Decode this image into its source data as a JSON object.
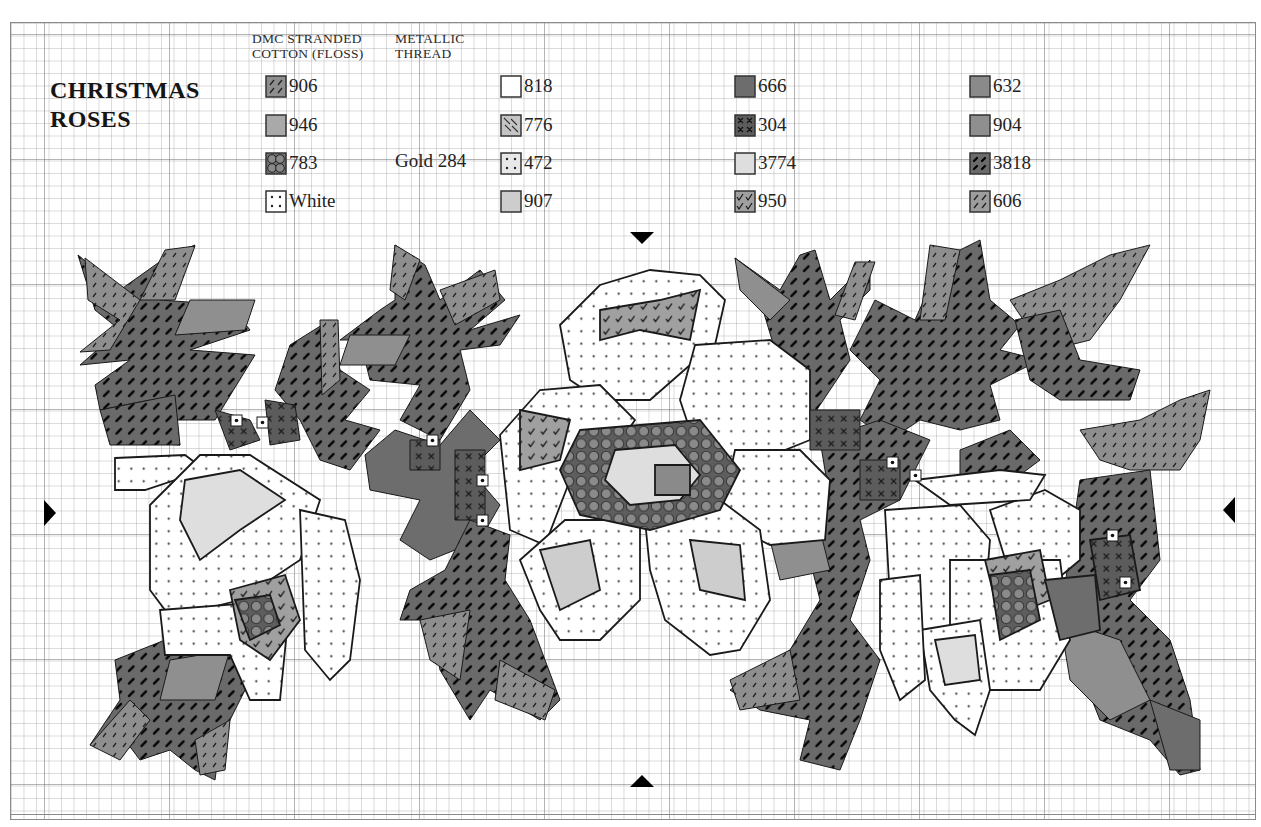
{
  "chart": {
    "title_lines": [
      "CHRISTMAS",
      "ROSES"
    ],
    "legend_headers": {
      "stranded": [
        "DMC STRANDED",
        "COTTON (FLOSS)"
      ],
      "metallic": [
        "METALLIC",
        "THREAD"
      ]
    },
    "metallic_thread": "Gold 284",
    "legend": [
      {
        "code": "906",
        "symbol": "diag-dash",
        "fill": "#8e8e8e",
        "col": 0,
        "row": 0
      },
      {
        "code": "946",
        "symbol": "solid",
        "fill": "#a9a9a9",
        "col": 0,
        "row": 1
      },
      {
        "code": "783",
        "symbol": "circles",
        "fill": "#707070",
        "col": 0,
        "row": 2
      },
      {
        "code": "White",
        "symbol": "dots",
        "fill": "#ffffff",
        "col": 0,
        "row": 3
      },
      {
        "code": "818",
        "symbol": "blank",
        "fill": "#ffffff",
        "col": 1,
        "row": 0
      },
      {
        "code": "776",
        "symbol": "back-diag",
        "fill": "#c4c4c4",
        "col": 1,
        "row": 1
      },
      {
        "code": "472",
        "symbol": "dots",
        "fill": "#e8e8e8",
        "col": 1,
        "row": 2
      },
      {
        "code": "907",
        "symbol": "solid",
        "fill": "#cdcdcd",
        "col": 1,
        "row": 3
      },
      {
        "code": "666",
        "symbol": "solid",
        "fill": "#6d6d6d",
        "col": 2,
        "row": 0
      },
      {
        "code": "304",
        "symbol": "cross",
        "fill": "#5c5c5c",
        "col": 2,
        "row": 1
      },
      {
        "code": "3774",
        "symbol": "solid",
        "fill": "#dedede",
        "col": 2,
        "row": 2
      },
      {
        "code": "950",
        "symbol": "check",
        "fill": "#a0a0a0",
        "col": 2,
        "row": 3
      },
      {
        "code": "632",
        "symbol": "solid",
        "fill": "#8a8a8a",
        "col": 3,
        "row": 0
      },
      {
        "code": "904",
        "symbol": "solid",
        "fill": "#8f8f8f",
        "col": 3,
        "row": 1
      },
      {
        "code": "3818",
        "symbol": "bold-dash",
        "fill": "#6a6a6a",
        "col": 3,
        "row": 2
      },
      {
        "code": "606",
        "symbol": "diag-dash",
        "fill": "#9d9d9d",
        "col": 3,
        "row": 3
      }
    ],
    "center_markers": [
      "top",
      "bottom",
      "left",
      "right"
    ],
    "grid": {
      "cell_px": 12.5,
      "major_every": 10
    },
    "motif": {
      "leaves": [
        {
          "pts": "78,255 120,290 165,258 195,245 160,300 230,305 250,330 190,350 255,355 215,420 170,420 180,445 110,440 150,400 100,410 95,385 130,360 80,365 120,330 95,310",
          "fill": "p3818"
        },
        {
          "pts": "85,258 140,300 110,350 80,352 120,320 88,300",
          "fill": "p906"
        },
        {
          "pts": "165,250 195,246 175,300 140,300",
          "fill": "p906"
        },
        {
          "pts": "190,300 255,300 245,330 175,335",
          "fill": "p904"
        },
        {
          "pts": "100,410 175,395 180,445 110,445",
          "fill": "p3818"
        },
        {
          "pts": "290,345 330,320 340,370 370,390 345,420 380,430 350,470 320,460 300,420 275,390",
          "fill": "p3818"
        },
        {
          "pts": "320,320 338,320 340,380 322,395",
          "fill": "p906"
        },
        {
          "pts": "395,245 425,265 440,300 480,270 505,300 470,330 520,315 500,345 460,350 470,390 440,440 400,420 420,385 370,380 365,360 400,340 340,340 380,310 395,300",
          "fill": "p3818"
        },
        {
          "pts": "395,245 420,260 405,300 390,290",
          "fill": "p906"
        },
        {
          "pts": "440,290 495,270 500,300 455,325",
          "fill": "p906"
        },
        {
          "pts": "350,335 410,335 395,365 340,365",
          "fill": "p904"
        },
        {
          "pts": "365,455 395,430 440,445 470,410 500,440 470,470 500,505 480,540 430,560 400,540 420,500 370,490",
          "fill": "p666"
        },
        {
          "pts": "410,590 445,570 470,520 510,535 505,580 530,620 560,700 540,720 490,690 470,720 440,670 430,620 400,620",
          "fill": "p3818"
        },
        {
          "pts": "420,620 470,610 460,680 430,660",
          "fill": "p906"
        },
        {
          "pts": "500,660 555,690 545,720 495,700",
          "fill": "p906"
        },
        {
          "pts": "735,258 780,290 800,255 815,250 830,300 870,260 870,290 840,320 850,360 810,420 790,420 805,380 775,350 760,300",
          "fill": "p3818"
        },
        {
          "pts": "735,258 790,300 770,320 740,290",
          "fill": "p904"
        },
        {
          "pts": "855,262 875,262 855,320 835,315",
          "fill": "p906"
        },
        {
          "pts": "875,300 915,320 935,275 950,255 980,240 990,300 1020,325 1000,350 1040,360 990,385 1000,420 960,430 920,420 890,440 860,420 880,380 850,350",
          "fill": "p3818"
        },
        {
          "pts": "930,245 960,250 945,320 920,320",
          "fill": "p906"
        },
        {
          "pts": "1010,300 1060,280 1110,255 1150,245 1120,300 1090,340 1050,350 1030,330",
          "fill": "p906"
        },
        {
          "pts": "1015,320 1060,310 1080,360 1140,370 1130,400 1060,400 1030,380",
          "fill": "p3818"
        },
        {
          "pts": "1080,430 1140,420 1180,400 1210,390 1200,440 1180,470 1130,470 1100,460",
          "fill": "p906"
        },
        {
          "pts": "960,450 1010,430 1040,460 1000,490 960,480",
          "fill": "p3818"
        },
        {
          "pts": "1080,480 1150,470 1160,560 1130,600 1170,640 1190,700 1200,770 1180,775 1150,740 1100,720 1080,670 1060,620",
          "fill": "p3818"
        },
        {
          "pts": "1060,620 1120,640 1150,700 1110,720 1070,680",
          "fill": "p904"
        },
        {
          "pts": "1150,700 1200,720 1200,770 1170,770",
          "fill": "p666"
        },
        {
          "pts": "820,440 880,420 930,440 900,500 860,520 870,560 850,620 880,660 860,720 840,770 800,760 810,720 760,710 730,690 790,650 820,600 810,560 770,540 830,500",
          "fill": "p3818"
        },
        {
          "pts": "730,680 790,650 800,700 740,710",
          "fill": "p906"
        },
        {
          "pts": "770,540 820,530 830,570 780,580",
          "fill": "p904"
        },
        {
          "pts": "115,660 165,640 205,625 250,600 270,640 240,700 220,740 215,780 195,770 170,750 140,760 125,740 90,745 120,700",
          "fill": "p3818"
        },
        {
          "pts": "90,745 130,700 150,720 120,760",
          "fill": "p906"
        },
        {
          "pts": "170,660 230,650 215,700 160,700",
          "fill": "p904"
        },
        {
          "pts": "195,740 230,720 225,770 200,775",
          "fill": "p906"
        },
        {
          "pts": "225,610 275,610 280,660 240,670",
          "fill": "p666"
        }
      ],
      "petals": [
        {
          "pts": "115,458 185,455 205,470 145,490 115,490",
          "fill": "pwhite"
        },
        {
          "pts": "150,505 200,455 250,455 320,500 300,560 240,600 200,610 165,610 150,590",
          "fill": "pwhite"
        },
        {
          "pts": "185,480 240,470 285,500 240,530 200,560 180,520",
          "fill": "p3774"
        },
        {
          "pts": "160,610 290,600 280,700 250,700 230,655 165,655",
          "fill": "pwhite"
        },
        {
          "pts": "300,510 345,520 360,580 350,660 330,680 305,650",
          "fill": "pwhite"
        },
        {
          "pts": "230,590 285,575 300,620 270,660 240,640",
          "fill": "p950"
        },
        {
          "pts": "235,600 270,595 280,625 250,640",
          "fill": "p783"
        },
        {
          "pts": "560,325 600,285 650,270 700,275 725,300 715,345 690,365 650,400 600,400 570,380",
          "fill": "pwhite"
        },
        {
          "pts": "600,310 660,300 700,290 690,340 640,330 600,340",
          "fill": "p950"
        },
        {
          "pts": "500,435 540,390 600,385 635,420 610,455 570,480 545,545 510,530",
          "fill": "pwhite"
        },
        {
          "pts": "695,345 770,340 810,370 810,440 760,460 700,460 680,400",
          "fill": "pwhite"
        },
        {
          "pts": "735,450 800,450 830,480 825,540 770,545 720,520",
          "fill": "pwhite"
        },
        {
          "pts": "520,560 565,520 640,520 640,600 600,640 560,640 540,610",
          "fill": "pwhite"
        },
        {
          "pts": "645,520 720,500 760,530 770,600 740,650 710,655 665,620 650,570",
          "fill": "pwhite"
        },
        {
          "pts": "580,430 700,420 740,470 720,510 650,530 580,515 560,470",
          "fill": "p783"
        },
        {
          "pts": "615,450 675,445 700,475 680,500 630,505 605,480",
          "fill": "p3774"
        },
        {
          "pts": "655,465 690,465 690,495 655,495",
          "fill": "p632"
        },
        {
          "pts": "540,550 590,540 600,590 560,610",
          "fill": "p907"
        },
        {
          "pts": "690,540 740,545 745,600 700,590",
          "fill": "p907"
        },
        {
          "pts": "520,410 570,420 560,460 520,470",
          "fill": "p950"
        },
        {
          "pts": "885,510 960,505 990,540 985,600 950,630 910,630 890,600",
          "fill": "pwhite"
        },
        {
          "pts": "990,510 1045,490 1080,510 1080,560 1050,585 1010,575",
          "fill": "pwhite"
        },
        {
          "pts": "915,480 1000,470 1045,475 1030,500 950,505",
          "fill": "pwhite"
        },
        {
          "pts": "950,560 1060,560 1070,640 1040,690 980,690 950,650",
          "fill": "pwhite"
        },
        {
          "pts": "920,630 980,620 990,690 975,735 955,720 930,690",
          "fill": "pwhite"
        },
        {
          "pts": "880,580 920,575 925,680 900,700 880,650",
          "fill": "pwhite"
        },
        {
          "pts": "985,560 1040,550 1050,600 1000,620",
          "fill": "p950"
        },
        {
          "pts": "990,575 1030,570 1040,620 1000,640",
          "fill": "p783"
        },
        {
          "pts": "935,640 975,635 980,680 945,685",
          "fill": "p3774"
        },
        {
          "pts": "1090,540 1130,535 1140,590 1100,600",
          "fill": "p304"
        },
        {
          "pts": "1045,580 1095,575 1100,630 1060,640",
          "fill": "p666"
        }
      ],
      "accents": [
        {
          "pts": "215,410 250,420 260,440 230,450",
          "fill": "p304"
        },
        {
          "pts": "265,400 295,405 300,440 270,445",
          "fill": "p304"
        },
        {
          "pts": "410,440 440,440 440,470 410,470",
          "fill": "p304"
        },
        {
          "pts": "455,450 485,450 485,520 455,520",
          "fill": "p304"
        },
        {
          "pts": "810,410 860,410 860,450 810,450",
          "fill": "p304"
        },
        {
          "pts": "860,460 900,460 900,500 860,500",
          "fill": "p304"
        }
      ],
      "centers": [
        {
          "x": 236,
          "y": 420
        },
        {
          "x": 262,
          "y": 422
        },
        {
          "x": 432,
          "y": 440
        },
        {
          "x": 482,
          "y": 480
        },
        {
          "x": 482,
          "y": 520
        },
        {
          "x": 892,
          "y": 462
        },
        {
          "x": 915,
          "y": 475
        },
        {
          "x": 1112,
          "y": 535
        },
        {
          "x": 1125,
          "y": 582
        }
      ]
    }
  }
}
